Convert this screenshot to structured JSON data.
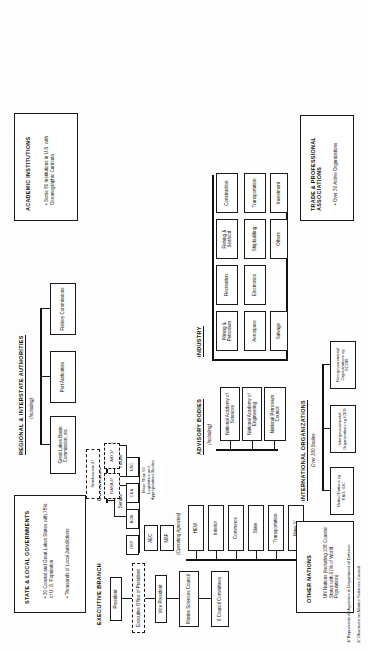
{
  "document": {
    "title": "Organization of U.S. Marine Affairs",
    "footnotes": [
      "1/ Represents all Agencies in Department of Defense",
      "2/ Observers on Marine Sciences Council"
    ]
  },
  "state_local": {
    "title": "STATE & LOCAL GOVERNMENTS",
    "bullets": [
      "30 Coastal and Great Lakes States with 75% of U. S. Population",
      "Thousands of Local Jurisdictions"
    ]
  },
  "regional": {
    "title": "REGIONAL & INTERSTATE AUTHORITIES",
    "subtitle": "(Including)",
    "boxes": [
      "Great Lakes Basin Commission, etc.",
      "Port Authorities",
      "Fishery Commissions"
    ]
  },
  "academic": {
    "title": "ACADEMIC INSTITUTIONS",
    "bullets": [
      "Some 80 Institutions in U.S. with Oceanographic Curricula"
    ]
  },
  "congress": {
    "title": "CONGRESS",
    "chambers": [
      "Senate",
      "House"
    ],
    "note": "More Than 50 Legislative and Appropriations Bodies"
  },
  "executive": {
    "title": "EXECUTIVE BRANCH",
    "president": "President",
    "eop": "Executive Office of President",
    "vice_president": "Vice President",
    "council": "Marine Sciences Council",
    "committees": "6 Council Committees",
    "operating_label": "(Operating Agencies)",
    "eop_agencies": [
      "OST",
      "BOB",
      "CEA",
      "NSC"
    ],
    "departments": [
      "Navy 1/",
      "Transportation",
      "State",
      "Commerce",
      "Interior",
      "HEW"
    ],
    "independents": [
      "NSF",
      "AEC"
    ],
    "observers": [
      "NASA 2/",
      "AID 2/",
      "Smithsonian 2/"
    ]
  },
  "advisory": {
    "title": "ADVISORY BODIES",
    "subtitle": "(Including)",
    "boxes": [
      "National Academy of Sciences",
      "National Academy of Engineering",
      "National Petroleum Council"
    ]
  },
  "industry": {
    "title": "INDUSTRY",
    "boxes": [
      "Mining & Petroleum",
      "Recreation",
      "Fishing & Seafood",
      "Construction",
      "Aerospace",
      "Electronics",
      "Shipbuilding",
      "Transportation",
      "Salvage",
      "Others",
      "Investment"
    ]
  },
  "other_nations": {
    "title": "OTHER NATIONS",
    "bullets": [
      "UN Nations (Including 108 Coastal States with 97% of World Population)"
    ]
  },
  "international": {
    "title": "INTERNATIONAL ORGANIZATIONS",
    "subtitle": "Over 100 Bodies",
    "boxes": [
      "United Nations eg FAO, IOC",
      "Intergovernmental Organizations eg ICES",
      "Non-governmental Organizations eg SCOR"
    ]
  },
  "trade": {
    "title": "TRADE & PROFESSIONAL ASSOCIATIONS",
    "bullets": [
      "Over 30 Active Organizations"
    ]
  }
}
